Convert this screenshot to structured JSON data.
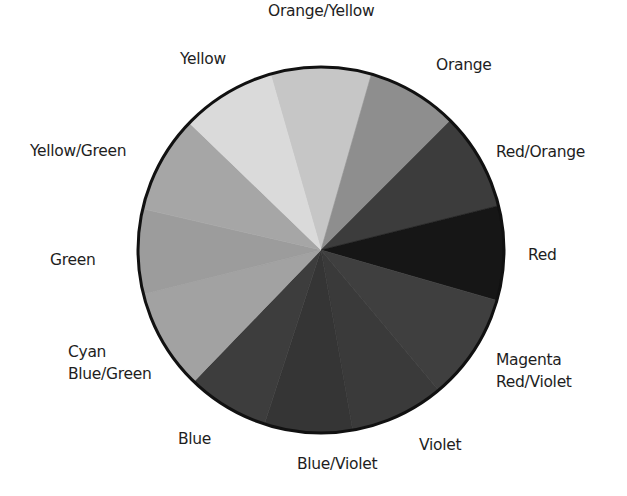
{
  "diagram": {
    "type": "color-wheel-pie",
    "center": [
      321,
      250
    ],
    "radius": 183,
    "outline_color": "#111111",
    "slices": [
      {
        "name": "Orange/Yellow",
        "start": -16,
        "end": 16,
        "fill": "#c6c6c6"
      },
      {
        "name": "Orange",
        "start": 16,
        "end": 45,
        "fill": "#8e8e8e"
      },
      {
        "name": "Red/Orange",
        "start": 45,
        "end": 76,
        "fill": "#3c3c3c"
      },
      {
        "name": "Red",
        "start": 76,
        "end": 106,
        "fill": "#161616"
      },
      {
        "name": "Magenta Red/Violet",
        "start": 106,
        "end": 140,
        "fill": "#3f3f3f"
      },
      {
        "name": "Violet",
        "start": 140,
        "end": 170,
        "fill": "#3a3a3a"
      },
      {
        "name": "Blue/Violet",
        "start": 170,
        "end": 198,
        "fill": "#353535"
      },
      {
        "name": "Blue",
        "start": 198,
        "end": 224,
        "fill": "#3d3d3d"
      },
      {
        "name": "Cyan Blue/Green",
        "start": 224,
        "end": 256,
        "fill": "#a2a2a2"
      },
      {
        "name": "Green",
        "start": 256,
        "end": 283,
        "fill": "#9c9c9c"
      },
      {
        "name": "Yellow/Green",
        "start": 283,
        "end": 314,
        "fill": "#a6a6a6"
      },
      {
        "name": "Yellow",
        "start": 314,
        "end": 344,
        "fill": "#dadada"
      }
    ]
  },
  "labels": [
    {
      "id": "orange-yellow",
      "lines": [
        "Orange/Yellow"
      ],
      "x": 268,
      "y": 0
    },
    {
      "id": "yellow",
      "lines": [
        "Yellow"
      ],
      "x": 180,
      "y": 48
    },
    {
      "id": "orange",
      "lines": [
        "Orange"
      ],
      "x": 436,
      "y": 54
    },
    {
      "id": "yellow-green",
      "lines": [
        "Yellow/Green"
      ],
      "x": 30,
      "y": 140
    },
    {
      "id": "red-orange",
      "lines": [
        "Red/Orange"
      ],
      "x": 496,
      "y": 141
    },
    {
      "id": "green",
      "lines": [
        "Green"
      ],
      "x": 50,
      "y": 249
    },
    {
      "id": "red",
      "lines": [
        "Red"
      ],
      "x": 528,
      "y": 244
    },
    {
      "id": "cyan-blue-green",
      "lines": [
        "Cyan",
        "Blue/Green"
      ],
      "x": 68,
      "y": 341
    },
    {
      "id": "magenta-red-violet",
      "lines": [
        "Magenta",
        "Red/Violet"
      ],
      "x": 496,
      "y": 349
    },
    {
      "id": "blue",
      "lines": [
        "Blue"
      ],
      "x": 178,
      "y": 428
    },
    {
      "id": "violet",
      "lines": [
        "Violet"
      ],
      "x": 419,
      "y": 434
    },
    {
      "id": "blue-violet",
      "lines": [
        "Blue/Violet"
      ],
      "x": 297,
      "y": 453
    }
  ]
}
